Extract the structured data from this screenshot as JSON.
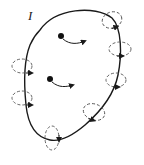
{
  "figure": {
    "label": "I",
    "colors": {
      "stroke": "#1a1a1a",
      "background": "#ffffff"
    },
    "elements": {
      "loop": "closed-curve",
      "field_circles_count": 7,
      "point_charges_count": 2
    }
  }
}
